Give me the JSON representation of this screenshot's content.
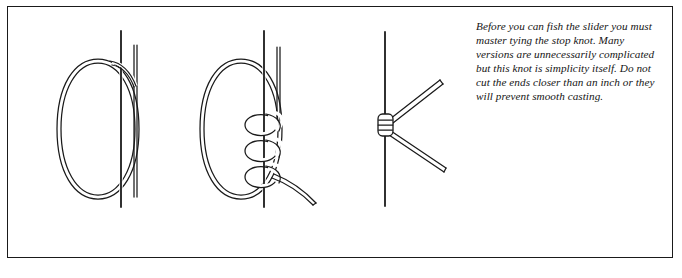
{
  "figure": {
    "kind": "instructional-illustration",
    "subject": "stop-knot",
    "border_color": "#1a1a1a",
    "background_color": "#ffffff",
    "ink_color": "#1a1a1a"
  },
  "caption": {
    "text": "Before you can fish the slider you must master tying the stop knot. Many versions are unnecessarily complicated but this knot is simplicity itself. Do not cut the ends closer than an inch or they will prevent smooth casting.",
    "style": "italic",
    "lines": [
      "Before you can fish the slider",
      "you must master tying the stop",
      "knot. Many versions are",
      "unnecessarily complicated but",
      "this knot is simplicity itself. Do",
      "not cut the ends closer than an",
      "inch or they will prevent smooth",
      "casting."
    ]
  },
  "diagrams": [
    {
      "step": 1,
      "name": "loop-alongside-main-line",
      "description": "Doubled line forms a long oval loop laid alongside the vertical main line, tag end hanging down to the right."
    },
    {
      "step": 2,
      "name": "three-coils-wrapped",
      "description": "The loop is wrapped three times around the main line forming three coils, with the tag end exiting to the lower right."
    },
    {
      "step": 3,
      "name": "finished-stop-knot",
      "description": "The finished barrel-shaped stop knot seated on the main line with two trimmed tag ends projecting to the right."
    }
  ]
}
